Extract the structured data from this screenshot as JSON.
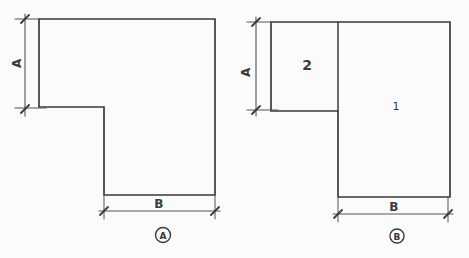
{
  "colors": {
    "ink": "#3a3a3a",
    "ink_light": "#555555",
    "paper": "#fbfbfb"
  },
  "figure_a": {
    "caption": "A",
    "height_dim_label": "A",
    "width_dim_label": "B"
  },
  "figure_b": {
    "caption": "B",
    "height_dim_label": "A",
    "width_dim_label": "B",
    "part_labels": {
      "large_rect": "1",
      "small_square": "2"
    }
  }
}
